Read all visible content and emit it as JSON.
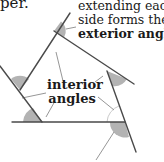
{
  "caption_fragment": "per.",
  "exterior_label": {
    "line1": "extending each",
    "line2": "side forms the",
    "line3": "exterior angles"
  },
  "interior_label": {
    "line1": "interior",
    "line2": "angles"
  },
  "colors": {
    "line": "#4a4a4a",
    "angle_fill": "#b3b3b3",
    "leader": "#8a8a8a",
    "text": "#1a1a1a"
  }
}
